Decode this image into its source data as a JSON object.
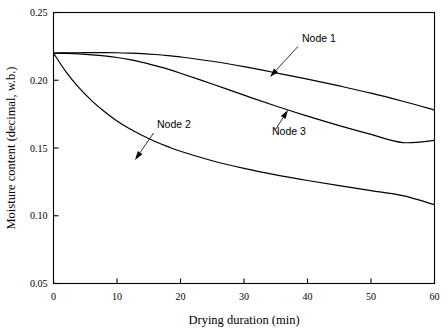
{
  "chart_data": {
    "type": "line",
    "title": "",
    "xlabel": "Drying duration (min)",
    "ylabel": "Moisture content (decimal, w.b.)",
    "xlim": [
      0,
      60
    ],
    "ylim": [
      0.05,
      0.25
    ],
    "xticks": [
      "0",
      "10",
      "20",
      "30",
      "40",
      "50",
      "60"
    ],
    "xtick_values": [
      0,
      10,
      20,
      30,
      40,
      50,
      60
    ],
    "yticks": [
      "0.05",
      "0.10",
      "0.15",
      "0.20",
      "0.25"
    ],
    "ytick_values": [
      0.05,
      0.1,
      0.15,
      0.2,
      0.25
    ],
    "grid": false,
    "legend": "inline annotations with leader lines",
    "x": [
      0,
      2,
      4,
      6,
      8,
      10,
      12,
      14,
      16,
      18,
      20,
      25,
      30,
      35,
      40,
      45,
      50,
      55,
      60
    ],
    "series": [
      {
        "name": "Node 1",
        "color": "#000000",
        "values": [
          0.22,
          0.2202,
          0.2203,
          0.2204,
          0.2204,
          0.2203,
          0.22,
          0.2196,
          0.219,
          0.2182,
          0.2172,
          0.214,
          0.21,
          0.2055,
          0.2008,
          0.1958,
          0.1905,
          0.1845,
          0.178
        ],
        "label_text": "Node 1",
        "label_x": 302,
        "label_y": 42,
        "arrow_tip_x": 270,
        "arrow_tip_y": 77
      },
      {
        "name": "Node 2",
        "color": "#000000",
        "values": [
          0.22,
          0.206,
          0.1945,
          0.185,
          0.177,
          0.17,
          0.1642,
          0.1592,
          0.1548,
          0.151,
          0.1476,
          0.1406,
          0.135,
          0.1302,
          0.126,
          0.1222,
          0.1185,
          0.1148,
          0.1082
        ],
        "label_text": "Node 2",
        "label_x": 157,
        "label_y": 128,
        "arrow_tip_x": 135,
        "arrow_tip_y": 160
      },
      {
        "name": "Node 3",
        "color": "#000000",
        "values": [
          0.22,
          0.2198,
          0.2194,
          0.2188,
          0.218,
          0.2168,
          0.2152,
          0.2132,
          0.2108,
          0.2082,
          0.2052,
          0.1972,
          0.189,
          0.181,
          0.1735,
          0.1665,
          0.16,
          0.154,
          0.1556
        ],
        "label_text": "Node 3",
        "label_x": 272,
        "label_y": 135,
        "arrow_tip_x": 288,
        "arrow_tip_y": 110
      }
    ]
  },
  "axes": {
    "x_title": "Drying duration (min)",
    "y_title": "Moisture content (decimal, w.b.)"
  },
  "labels": {
    "node1": "Node 1",
    "node2": "Node 2",
    "node3": "Node 3"
  }
}
